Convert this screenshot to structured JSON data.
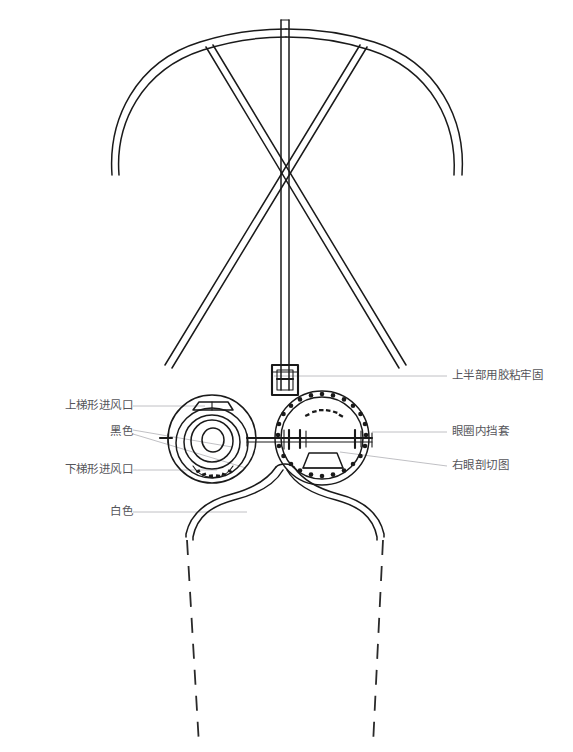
{
  "document": {
    "type": "technical-line-drawing",
    "subject": "goggles-with-head-frame-assembly",
    "background_color": "#ffffff",
    "ink_color": "#1a1a1a",
    "label_color": "#55555a",
    "leader_color": "#b9b9bd",
    "width": 573,
    "height": 752
  },
  "labels": {
    "left": [
      {
        "id": "upper-trapezoid-air-inlet",
        "text": "上梯形进风口",
        "x": 128,
        "y": 406,
        "leader_to_x": 205,
        "leader_to_y": 406
      },
      {
        "id": "black-color",
        "text": "黑色",
        "x": 128,
        "y": 432,
        "leader_to_x": 232,
        "leader_to_y": 447
      },
      {
        "id": "lower-trapezoid-air-inlet",
        "text": "下梯形进风口",
        "x": 128,
        "y": 470,
        "leader_to_x": 217,
        "leader_to_y": 470
      },
      {
        "id": "white-color",
        "text": "白色",
        "x": 128,
        "y": 512,
        "leader_to_x": 247,
        "leader_to_y": 512
      }
    ],
    "right": [
      {
        "id": "upper-part-glued-firmly",
        "text": "上半部用胶粘牢固",
        "x": 452,
        "y": 376,
        "leader_to_x": 274,
        "leader_to_y": 376
      },
      {
        "id": "inner-eye-ring-sleeve",
        "text": "眼圈内挡套",
        "x": 452,
        "y": 432,
        "leader_to_x": 370,
        "leader_to_y": 437
      },
      {
        "id": "right-eye-section-view",
        "text": "右眼剖切图",
        "x": 452,
        "y": 466,
        "leader_to_x": 340,
        "leader_to_y": 466
      }
    ]
  },
  "components": {
    "arch_frame": "curved-bow-headband",
    "center_rod": "vertical-center-rod",
    "cross_struts": "x-crossing-diagonal-struts",
    "sleeve_connector": "rod-sleeve-connector",
    "left_eyepiece": "left-goggle-lens-assembly",
    "right_eyepiece": "right-goggle-section-view",
    "axle_bar": "horizontal-connecting-axle",
    "skirt": "face-skirt-outline",
    "dashed_skirt": "dashed-lower-skirt-outline"
  }
}
